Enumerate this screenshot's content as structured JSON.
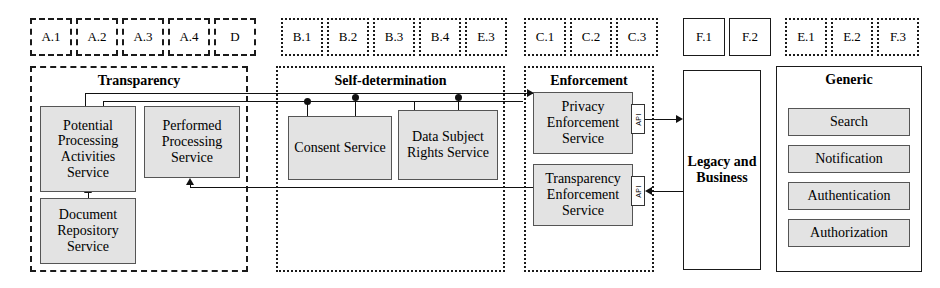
{
  "diagram": {
    "tags": [
      {
        "id": "tag-a1",
        "label": "A.1",
        "style": "dashed",
        "x": 30,
        "y": 18,
        "w": 42,
        "h": 38
      },
      {
        "id": "tag-a2",
        "label": "A.2",
        "style": "dashed",
        "x": 76,
        "y": 18,
        "w": 42,
        "h": 38
      },
      {
        "id": "tag-a3",
        "label": "A.3",
        "style": "dashed",
        "x": 122,
        "y": 18,
        "w": 42,
        "h": 38
      },
      {
        "id": "tag-a4",
        "label": "A.4",
        "style": "dashed",
        "x": 168,
        "y": 18,
        "w": 42,
        "h": 38
      },
      {
        "id": "tag-d",
        "label": "D",
        "style": "dashed",
        "x": 214,
        "y": 18,
        "w": 42,
        "h": 38
      },
      {
        "id": "tag-b1",
        "label": "B.1",
        "style": "dotted",
        "x": 281,
        "y": 18,
        "w": 42,
        "h": 38
      },
      {
        "id": "tag-b2",
        "label": "B.2",
        "style": "dotted",
        "x": 327,
        "y": 18,
        "w": 42,
        "h": 38
      },
      {
        "id": "tag-b3",
        "label": "B.3",
        "style": "dotted",
        "x": 373,
        "y": 18,
        "w": 42,
        "h": 38
      },
      {
        "id": "tag-b4",
        "label": "B.4",
        "style": "dotted",
        "x": 419,
        "y": 18,
        "w": 42,
        "h": 38
      },
      {
        "id": "tag-e3",
        "label": "E.3",
        "style": "dotted",
        "x": 465,
        "y": 18,
        "w": 42,
        "h": 38
      },
      {
        "id": "tag-c1",
        "label": "C.1",
        "style": "dotted",
        "x": 524,
        "y": 18,
        "w": 42,
        "h": 38
      },
      {
        "id": "tag-c2",
        "label": "C.2",
        "style": "dotted",
        "x": 570,
        "y": 18,
        "w": 42,
        "h": 38
      },
      {
        "id": "tag-c3",
        "label": "C.3",
        "style": "dotted",
        "x": 616,
        "y": 18,
        "w": 42,
        "h": 38
      },
      {
        "id": "tag-f1",
        "label": "F.1",
        "style": "solid",
        "x": 683,
        "y": 18,
        "w": 42,
        "h": 38
      },
      {
        "id": "tag-f2",
        "label": "F.2",
        "style": "solid",
        "x": 729,
        "y": 18,
        "w": 42,
        "h": 38
      },
      {
        "id": "tag-e1",
        "label": "E.1",
        "style": "dotted",
        "x": 785,
        "y": 18,
        "w": 42,
        "h": 38
      },
      {
        "id": "tag-e2",
        "label": "E.2",
        "style": "dotted",
        "x": 831,
        "y": 18,
        "w": 42,
        "h": 38
      },
      {
        "id": "tag-f3",
        "label": "F.3",
        "style": "dotted",
        "x": 877,
        "y": 18,
        "w": 42,
        "h": 38
      }
    ],
    "groups": [
      {
        "id": "group-transparency",
        "title": "Transparency",
        "style": "dashed",
        "x": 30,
        "y": 66,
        "w": 218,
        "h": 206
      },
      {
        "id": "group-self-determination",
        "title": "Self-determination",
        "style": "dotted",
        "x": 276,
        "y": 66,
        "w": 229,
        "h": 206
      },
      {
        "id": "group-enforcement",
        "title": "Enforcement",
        "style": "dotted",
        "x": 524,
        "y": 66,
        "w": 130,
        "h": 206
      },
      {
        "id": "group-generic",
        "title": "Generic",
        "style": "solid",
        "x": 776,
        "y": 66,
        "w": 146,
        "h": 206
      }
    ],
    "services": [
      {
        "id": "svc-potential-processing-activities",
        "label": "Potential Processing Activities Service",
        "x": 40,
        "y": 106,
        "w": 96,
        "h": 86,
        "fill": "grey"
      },
      {
        "id": "svc-document-repository",
        "label": "Document Repository Service",
        "x": 40,
        "y": 198,
        "w": 96,
        "h": 66,
        "fill": "grey"
      },
      {
        "id": "svc-performed-processing",
        "label": "Performed Processing Service",
        "x": 144,
        "y": 106,
        "w": 96,
        "h": 72,
        "fill": "grey"
      },
      {
        "id": "svc-consent",
        "label": "Consent Service",
        "x": 288,
        "y": 116,
        "w": 104,
        "h": 64,
        "fill": "grey"
      },
      {
        "id": "svc-data-subject-rights",
        "label": "Data Subject Rights Service",
        "x": 398,
        "y": 110,
        "w": 100,
        "h": 70,
        "fill": "grey"
      },
      {
        "id": "svc-privacy-enforcement",
        "label": "Privacy Enforcement Service",
        "x": 533,
        "y": 92,
        "w": 100,
        "h": 62,
        "fill": "grey"
      },
      {
        "id": "svc-transparency-enforcement",
        "label": "Transparency Enforcement Service",
        "x": 533,
        "y": 164,
        "w": 100,
        "h": 62,
        "fill": "grey"
      },
      {
        "id": "svc-legacy-and-business",
        "label": "Legacy and Business",
        "x": 683,
        "y": 70,
        "w": 78,
        "h": 200,
        "fill": "white"
      },
      {
        "id": "svc-search",
        "label": "Search",
        "x": 788,
        "y": 108,
        "w": 122,
        "h": 28,
        "fill": "grey"
      },
      {
        "id": "svc-notification",
        "label": "Notification",
        "x": 788,
        "y": 145,
        "w": 122,
        "h": 28,
        "fill": "grey"
      },
      {
        "id": "svc-authentication",
        "label": "Authentication",
        "x": 788,
        "y": 182,
        "w": 122,
        "h": 28,
        "fill": "grey"
      },
      {
        "id": "svc-authorization",
        "label": "Authorization",
        "x": 788,
        "y": 219,
        "w": 122,
        "h": 28,
        "fill": "grey"
      }
    ],
    "api_connectors": [
      {
        "id": "api-privacy-enforcement",
        "label": "API",
        "x": 631,
        "y": 104,
        "w": 14,
        "h": 30
      },
      {
        "id": "api-transparency-enforcement",
        "label": "API",
        "x": 631,
        "y": 176,
        "w": 14,
        "h": 30
      }
    ]
  }
}
